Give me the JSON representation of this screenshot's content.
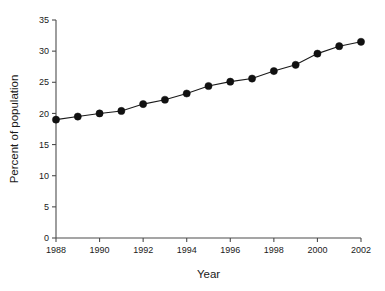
{
  "chart_data": {
    "type": "line",
    "title": "",
    "xlabel": "Year",
    "ylabel": "Percent of population",
    "x": [
      1988,
      1989,
      1990,
      1991,
      1992,
      1993,
      1994,
      1995,
      1996,
      1997,
      1998,
      1999,
      2000,
      2001,
      2002
    ],
    "values": [
      19.0,
      19.5,
      20.0,
      20.4,
      21.5,
      22.2,
      23.2,
      24.4,
      25.1,
      25.6,
      26.8,
      27.8,
      29.6,
      30.8,
      31.5
    ],
    "series": [
      {
        "name": "Percent of population",
        "values": [
          19.0,
          19.5,
          20.0,
          20.4,
          21.5,
          22.2,
          23.2,
          24.4,
          25.1,
          25.6,
          26.8,
          27.8,
          29.6,
          30.8,
          31.5
        ]
      }
    ],
    "xlim": [
      1988,
      2002
    ],
    "ylim": [
      0,
      35
    ],
    "xticks": [
      1988,
      1990,
      1992,
      1994,
      1996,
      1998,
      2000,
      2002
    ],
    "xtick_labels": [
      "1988",
      "1990",
      "1992",
      "1994",
      "1996",
      "1998",
      "2000",
      "2002"
    ],
    "yticks": [
      0,
      5,
      10,
      15,
      20,
      25,
      30,
      35
    ],
    "ytick_labels": [
      "0",
      "5",
      "10",
      "15",
      "20",
      "25",
      "30",
      "35"
    ],
    "grid": false,
    "legend": false,
    "marker": "filled-circle",
    "line_color": "#1a1a1a",
    "marker_color": "#111111",
    "background_color": "#ffffff"
  }
}
